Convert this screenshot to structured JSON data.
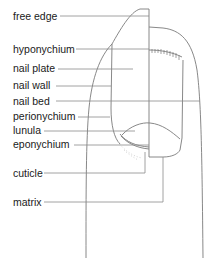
{
  "diagram": {
    "labels": [
      {
        "id": "free-edge",
        "text": "free edge",
        "y": 10
      },
      {
        "id": "hyponychium",
        "text": "hyponychium",
        "y": 43
      },
      {
        "id": "nail-plate",
        "text": "nail plate",
        "y": 62
      },
      {
        "id": "nail-wall",
        "text": "nail wall",
        "y": 78
      },
      {
        "id": "nail-bed",
        "text": "nail bed",
        "y": 94
      },
      {
        "id": "perionychium",
        "text": "perionychium",
        "y": 110
      },
      {
        "id": "lunula",
        "text": "lunula",
        "y": 124
      },
      {
        "id": "eponychium",
        "text": "eponychium",
        "y": 138
      },
      {
        "id": "cuticle",
        "text": "cuticle",
        "y": 169
      },
      {
        "id": "matrix",
        "text": "matrix",
        "y": 196
      }
    ],
    "colors": {
      "outline": "#7a7a7a",
      "leader": "#8a8a8a",
      "text": "#1a1a1a",
      "background": "#ffffff"
    }
  }
}
